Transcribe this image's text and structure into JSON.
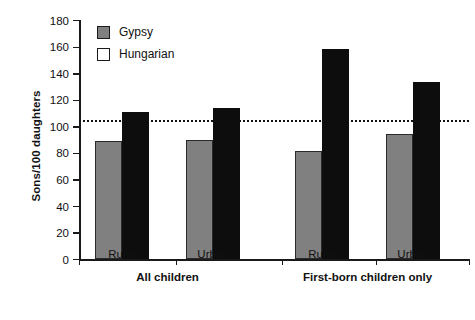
{
  "chart_data": {
    "type": "bar",
    "title": "",
    "xlabel": "",
    "ylabel": "Sons/100 daughters",
    "ylim": [
      0,
      180
    ],
    "ytick_values": [
      0,
      20,
      40,
      60,
      80,
      100,
      120,
      140,
      160,
      180
    ],
    "ytick_labels": [
      "0",
      "20",
      "40",
      "60",
      "80",
      "100",
      "120",
      "140",
      "160",
      "180"
    ],
    "grid": false,
    "legend_position": "top-left",
    "categories": [
      "Rural",
      "Urban",
      "Rural",
      "Urban"
    ],
    "group_labels": [
      "All children",
      "First-born children only"
    ],
    "groups": [
      {
        "name": "All children",
        "categories": [
          "Rural",
          "Urban"
        ]
      },
      {
        "name": "First-born children only",
        "categories": [
          "Rural",
          "Urban"
        ]
      }
    ],
    "series": [
      {
        "name": "Gypsy",
        "color": "#808080",
        "values": [
          89,
          90,
          81,
          94
        ]
      },
      {
        "name": "Hungarian",
        "color": "#0d0d0d",
        "values": [
          111,
          114,
          158,
          133
        ]
      }
    ],
    "reference_line": {
      "value": 105,
      "style": "dotted",
      "color": "#111111"
    }
  },
  "legend": {
    "items": [
      {
        "label": "Gypsy",
        "swatch": "gray-filled-square"
      },
      {
        "label": "Hungarian",
        "swatch": "white-open-square"
      }
    ]
  }
}
